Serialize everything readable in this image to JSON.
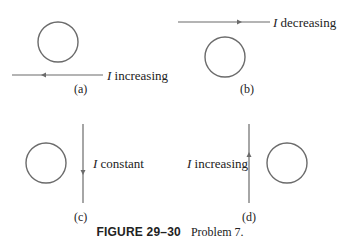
{
  "figure": {
    "number_label": "FIGURE 29–30",
    "caption": "Problem 7.",
    "colors": {
      "line": "#6b6b6b",
      "text": "#222222",
      "background": "#ffffff"
    }
  },
  "panels": [
    {
      "id": "a",
      "sublabel": "(a)",
      "current_symbol": "I",
      "current_state": "increasing",
      "wire": "horizontal",
      "wire_position": "below loop",
      "arrow_direction": "left"
    },
    {
      "id": "b",
      "sublabel": "(b)",
      "current_symbol": "I",
      "current_state": "decreasing",
      "wire": "horizontal",
      "wire_position": "above loop",
      "arrow_direction": "right"
    },
    {
      "id": "c",
      "sublabel": "(c)",
      "current_symbol": "I",
      "current_state": "constant",
      "wire": "vertical",
      "wire_position": "right of loop",
      "arrow_direction": "down"
    },
    {
      "id": "d",
      "sublabel": "(d)",
      "current_symbol": "I",
      "current_state": "increasing",
      "wire": "vertical",
      "wire_position": "left of loop",
      "arrow_direction": "up"
    }
  ]
}
